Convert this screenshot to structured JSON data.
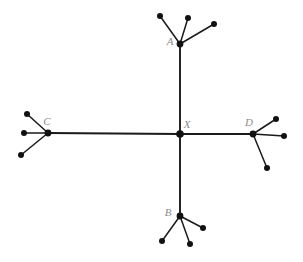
{
  "figure": {
    "width": 303,
    "height": 262,
    "background_color": "#ffffff",
    "edge_color": "#1a1a1a",
    "node_color": "#111111",
    "label_color": "#8c8c8c"
  },
  "labels": {
    "x": "X",
    "a": "A",
    "b": "B",
    "c": "C",
    "d": "D"
  },
  "chart_data": {
    "type": "diagram",
    "subtype": "unrooted-tree",
    "center": {
      "id": "X",
      "label": "X",
      "x": 180,
      "y": 134,
      "label_x": 187,
      "label_y": 128
    },
    "internal_nodes": [
      {
        "id": "A",
        "label": "A",
        "x": 180,
        "y": 44,
        "label_x": 170,
        "label_y": 45,
        "leaf_count": 3
      },
      {
        "id": "B",
        "label": "B",
        "x": 180,
        "y": 216,
        "label_x": 168,
        "label_y": 216,
        "leaf_count": 3
      },
      {
        "id": "C",
        "label": "C",
        "x": 48,
        "y": 133,
        "label_x": 47,
        "label_y": 125,
        "leaf_count": 3
      },
      {
        "id": "D",
        "label": "D",
        "x": 253,
        "y": 134,
        "label_x": 249,
        "label_y": 126,
        "leaf_count": 3
      }
    ],
    "trunk_edges": [
      {
        "from": "X",
        "to": "A"
      },
      {
        "from": "X",
        "to": "B"
      },
      {
        "from": "X",
        "to": "C"
      },
      {
        "from": "X",
        "to": "D"
      }
    ],
    "leaves": [
      {
        "parent": "A",
        "x": 160,
        "y": 16
      },
      {
        "parent": "A",
        "x": 188,
        "y": 18
      },
      {
        "parent": "A",
        "x": 214,
        "y": 24
      },
      {
        "parent": "B",
        "x": 162,
        "y": 241
      },
      {
        "parent": "B",
        "x": 190,
        "y": 244
      },
      {
        "parent": "B",
        "x": 203,
        "y": 228
      },
      {
        "parent": "C",
        "x": 27,
        "y": 114
      },
      {
        "parent": "C",
        "x": 24,
        "y": 133
      },
      {
        "parent": "C",
        "x": 21,
        "y": 155
      },
      {
        "parent": "D",
        "x": 276,
        "y": 119
      },
      {
        "parent": "D",
        "x": 284,
        "y": 136
      },
      {
        "parent": "D",
        "x": 267,
        "y": 168
      }
    ],
    "node_radius": 3.4,
    "leaf_radius": 3.0
  }
}
